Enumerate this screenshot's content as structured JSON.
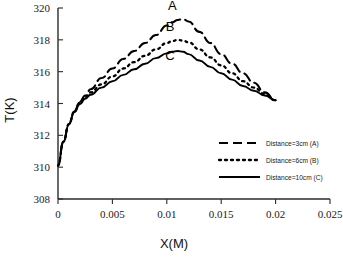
{
  "chart_data": {
    "type": "line",
    "title": "",
    "xlabel": "X(M)",
    "ylabel": "T(K)",
    "xlim": [
      0,
      0.025
    ],
    "ylim": [
      308,
      320
    ],
    "xticks": [
      "0",
      "0.005",
      "0.01",
      "0.015",
      "0.02",
      "0.025"
    ],
    "xtick_values": [
      0,
      0.005,
      0.01,
      0.015,
      0.02,
      0.025
    ],
    "yticks": [
      "308",
      "310",
      "312",
      "314",
      "316",
      "318",
      "320"
    ],
    "ytick_values": [
      308,
      310,
      312,
      314,
      316,
      318,
      320
    ],
    "grid": false,
    "legend_position": "center-right",
    "series": [
      {
        "name": "Distance=3cm (A)",
        "label": "A",
        "style": "dashed",
        "color": "#000000",
        "x": [
          0,
          0.0005,
          0.001,
          0.0015,
          0.002,
          0.0025,
          0.003,
          0.004,
          0.005,
          0.006,
          0.007,
          0.008,
          0.009,
          0.01,
          0.0105,
          0.011,
          0.0115,
          0.012,
          0.013,
          0.014,
          0.015,
          0.016,
          0.017,
          0.018,
          0.019,
          0.02
        ],
        "y": [
          310.1,
          311.6,
          312.7,
          313.5,
          314.1,
          314.5,
          314.9,
          315.6,
          316.2,
          316.8,
          317.3,
          317.8,
          318.3,
          318.9,
          319.1,
          319.25,
          319.3,
          319.15,
          318.5,
          317.8,
          317.1,
          316.5,
          315.9,
          315.3,
          314.7,
          314.2
        ]
      },
      {
        "name": "Distance=6cm (B)",
        "label": "B",
        "style": "dotted",
        "color": "#000000",
        "x": [
          0,
          0.0005,
          0.001,
          0.0015,
          0.002,
          0.0025,
          0.003,
          0.004,
          0.005,
          0.006,
          0.007,
          0.008,
          0.009,
          0.01,
          0.0105,
          0.011,
          0.0115,
          0.012,
          0.013,
          0.014,
          0.015,
          0.016,
          0.017,
          0.018,
          0.019,
          0.02
        ],
        "y": [
          310.1,
          311.6,
          312.7,
          313.5,
          314.05,
          314.4,
          314.7,
          315.2,
          315.7,
          316.2,
          316.6,
          317.0,
          317.4,
          317.8,
          317.92,
          318.0,
          317.95,
          317.85,
          317.4,
          316.9,
          316.4,
          315.9,
          315.4,
          315.0,
          314.6,
          314.2
        ]
      },
      {
        "name": "Distance=10cm (C)",
        "label": "C",
        "style": "solid",
        "color": "#000000",
        "x": [
          0,
          0.0005,
          0.001,
          0.0015,
          0.002,
          0.0025,
          0.003,
          0.004,
          0.005,
          0.006,
          0.007,
          0.008,
          0.009,
          0.01,
          0.0105,
          0.011,
          0.0115,
          0.012,
          0.013,
          0.014,
          0.015,
          0.016,
          0.017,
          0.018,
          0.019,
          0.02
        ],
        "y": [
          310.1,
          311.6,
          312.7,
          313.45,
          313.95,
          314.3,
          314.55,
          315.0,
          315.4,
          315.8,
          316.15,
          316.5,
          316.85,
          317.15,
          317.25,
          317.3,
          317.25,
          317.1,
          316.7,
          316.3,
          315.9,
          315.5,
          315.1,
          314.8,
          314.5,
          314.2
        ]
      }
    ],
    "legend": [
      {
        "label": "Distance=3cm (A)",
        "style": "dashed"
      },
      {
        "label": "Distance=6cm (B)",
        "style": "dotted"
      },
      {
        "label": "Distance=10cm (C)",
        "style": "solid"
      }
    ],
    "annotations": [
      {
        "text": "A",
        "x": 0.0105,
        "y": 319.9
      },
      {
        "text": "B",
        "x": 0.0103,
        "y": 318.55
      },
      {
        "text": "C",
        "x": 0.0103,
        "y": 316.75
      }
    ]
  }
}
